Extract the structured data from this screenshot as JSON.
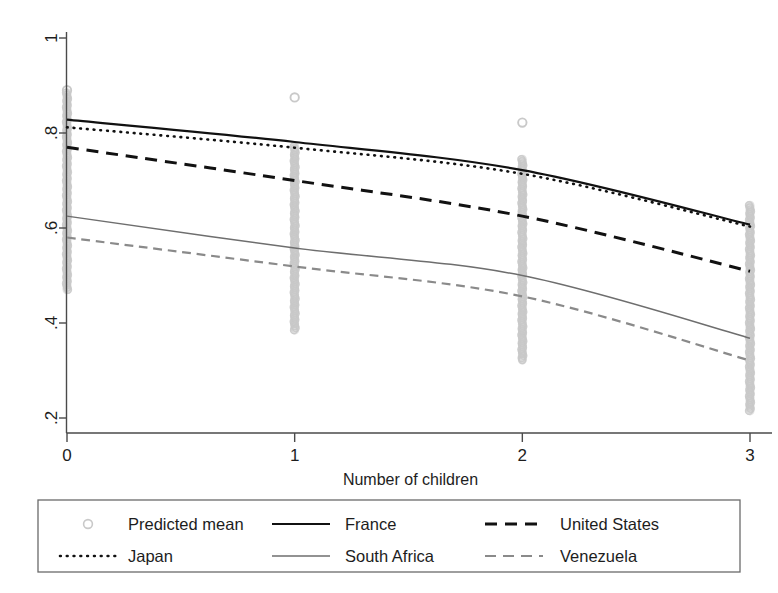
{
  "chart_data": {
    "type": "line",
    "title": "",
    "xlabel": "Number of children",
    "ylabel": "",
    "xlim": [
      -0.12,
      3.12
    ],
    "ylim": [
      0.155,
      1.04
    ],
    "xticks": [
      0,
      1,
      2,
      3
    ],
    "xtick_labels": [
      "0",
      "1",
      "2",
      "3"
    ],
    "yticks": [
      0.2,
      0.4,
      0.6,
      0.8,
      1.0
    ],
    "ytick_labels": [
      ".2",
      ".4",
      ".6",
      ".8",
      "1"
    ],
    "grid": false,
    "legend_position": "bottom",
    "x": [
      0,
      1,
      2,
      3
    ],
    "series": [
      {
        "name": "France",
        "style": "solid",
        "color": "#111111",
        "width": 2.2,
        "values": [
          0.828,
          0.781,
          0.722,
          0.607
        ]
      },
      {
        "name": "Japan",
        "style": "dotted",
        "color": "#111111",
        "width": 2.6,
        "values": [
          0.812,
          0.769,
          0.714,
          0.603
        ]
      },
      {
        "name": "United States",
        "style": "dashed",
        "color": "#111111",
        "width": 3.0,
        "values": [
          0.77,
          0.7,
          0.625,
          0.509
        ]
      },
      {
        "name": "South Africa",
        "style": "solid",
        "color": "#6e6e6e",
        "width": 1.5,
        "values": [
          0.625,
          0.558,
          0.5,
          0.368
        ]
      },
      {
        "name": "Venezuela",
        "style": "dashed",
        "color": "#8a8a8a",
        "width": 2.2,
        "values": [
          0.58,
          0.519,
          0.456,
          0.321
        ]
      }
    ],
    "scatter": {
      "name": "Predicted mean",
      "marker": "circle-open",
      "color": "#c9c9c9",
      "columns": [
        {
          "x": 0,
          "min": 0.47,
          "max": 0.89,
          "dense_min": 0.47,
          "dense_max": 0.885,
          "outliers": [
            0.89
          ]
        },
        {
          "x": 1,
          "min": 0.385,
          "max": 0.875,
          "dense_min": 0.385,
          "dense_max": 0.772,
          "outliers": [
            0.875
          ]
        },
        {
          "x": 2,
          "min": 0.322,
          "max": 0.822,
          "dense_min": 0.322,
          "dense_max": 0.745,
          "outliers": [
            0.822
          ]
        },
        {
          "x": 3,
          "min": 0.215,
          "max": 0.648,
          "dense_min": 0.215,
          "dense_max": 0.648,
          "outliers": []
        }
      ]
    }
  },
  "axes": {
    "x_title": "Number of children",
    "x_tick_labels": [
      "0",
      "1",
      "2",
      "3"
    ],
    "y_tick_labels": [
      "1",
      ".8",
      ".6",
      ".4",
      ".2"
    ]
  },
  "legend": {
    "entries": [
      {
        "label": "Predicted mean",
        "key": "marker"
      },
      {
        "label": "France",
        "key": "solid-dark"
      },
      {
        "label": "United States",
        "key": "dashed-dark"
      },
      {
        "label": "Japan",
        "key": "dotted-dark"
      },
      {
        "label": "South Africa",
        "key": "solid-gray"
      },
      {
        "label": "Venezuela",
        "key": "dashed-gray"
      }
    ]
  },
  "colors": {
    "axis": "#4a4a4a",
    "dark_line": "#111111",
    "gray_line": "#6e6e6e",
    "light_gray_line": "#8a8a8a",
    "scatter": "#c9c9c9",
    "legend_border": "#6a6a6a",
    "background": "#ffffff"
  }
}
